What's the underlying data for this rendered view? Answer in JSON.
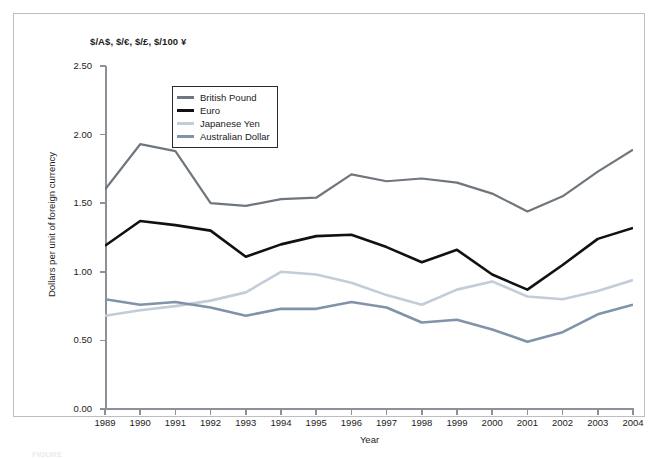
{
  "figure": {
    "caption_stub": "FIGURE"
  },
  "chart_data": {
    "type": "line",
    "title": "$/A$, $/€, $/£, $/100 ¥",
    "xlabel": "Year",
    "ylabel": "Dollars per unit of foreign currency",
    "xlim": [
      1989,
      2004
    ],
    "ylim": [
      0.0,
      2.5
    ],
    "ytick_step": 0.5,
    "grid": false,
    "legend_position": "upper-left-inside",
    "x": [
      1989,
      1990,
      1991,
      1992,
      1993,
      1994,
      1995,
      1996,
      1997,
      1998,
      1999,
      2000,
      2001,
      2002,
      2003,
      2004
    ],
    "xticklabels": [
      "1989",
      "1990",
      "1991",
      "1992",
      "1993",
      "1994",
      "1995",
      "1996",
      "1997",
      "1998",
      "1999",
      "2000",
      "2001",
      "2002",
      "2003",
      "2004"
    ],
    "yticklabels": [
      "0.00",
      "0.50",
      "1.00",
      "1.50",
      "2.00",
      "2.50"
    ],
    "yticks": [
      0.0,
      0.5,
      1.0,
      1.5,
      2.0,
      2.5
    ],
    "series": [
      {
        "name": "British Pound",
        "color": "#6f767d",
        "width": 2.2,
        "values": [
          1.6,
          1.93,
          1.88,
          1.5,
          1.48,
          1.53,
          1.54,
          1.71,
          1.66,
          1.68,
          1.65,
          1.57,
          1.44,
          1.55,
          1.73,
          1.89
        ]
      },
      {
        "name": "Euro",
        "color": "#111111",
        "width": 2.6,
        "values": [
          1.19,
          1.37,
          1.34,
          1.3,
          1.11,
          1.2,
          1.26,
          1.27,
          1.18,
          1.07,
          1.16,
          0.98,
          0.87,
          1.05,
          1.24,
          1.32
        ]
      },
      {
        "name": "Japanese Yen",
        "color": "#c3ccd9",
        "width": 2.6,
        "values": [
          0.68,
          0.72,
          0.75,
          0.79,
          0.85,
          1.0,
          0.98,
          0.92,
          0.83,
          0.76,
          0.87,
          0.93,
          0.82,
          0.8,
          0.86,
          0.94
        ]
      },
      {
        "name": "Australian Dollar",
        "color": "#8193a8",
        "width": 2.6,
        "values": [
          0.8,
          0.76,
          0.78,
          0.74,
          0.68,
          0.73,
          0.73,
          0.78,
          0.74,
          0.63,
          0.65,
          0.58,
          0.49,
          0.56,
          0.69,
          0.76
        ]
      }
    ]
  },
  "legend": {
    "items": [
      {
        "label": "British Pound",
        "color": "#6f767d"
      },
      {
        "label": "Euro",
        "color": "#111111"
      },
      {
        "label": "Japanese Yen",
        "color": "#c3ccd9"
      },
      {
        "label": "Australian Dollar",
        "color": "#8193a8"
      }
    ]
  }
}
